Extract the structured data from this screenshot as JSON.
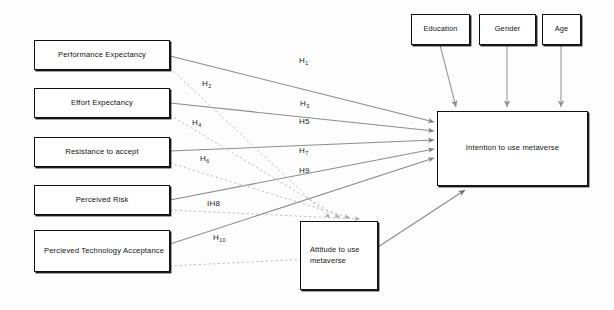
{
  "diagram": {
    "type": "conceptual-path-diagram",
    "colors": {
      "box_border": "#111111",
      "box_fill": "#ffffff",
      "solid_edge": "#8c8c8c",
      "dashed_edge": "#b4b4b4",
      "moderator_edge": "#9a9a9a",
      "label_text": "#1b1b1b",
      "background": "#fdfdfd"
    },
    "predictors": [
      {
        "id": "performance_expectancy",
        "label": "Performance Expectancy",
        "x": 34,
        "y": 40,
        "w": 136,
        "h": 30
      },
      {
        "id": "effort_expectancy",
        "label": "Effort Expectancy",
        "x": 34,
        "y": 88,
        "w": 136,
        "h": 30
      },
      {
        "id": "resistance_to_accept",
        "label": "Resistance to accept",
        "x": 34,
        "y": 137,
        "w": 136,
        "h": 30
      },
      {
        "id": "perceived_risk",
        "label": "Perceived Risk",
        "x": 34,
        "y": 185,
        "w": 136,
        "h": 30
      },
      {
        "id": "perceived_technology_acceptance",
        "label": "Percieved Technology Acceptance",
        "x": 34,
        "y": 230,
        "w": 136,
        "h": 42
      }
    ],
    "mediator": {
      "id": "attitude_to_use_metaverse",
      "label": "Attitude to use metaverse",
      "x": 300,
      "y": 221,
      "w": 78,
      "h": 69
    },
    "outcome": {
      "id": "intention_to_use_metaverse",
      "label": "Intention to use metaverse",
      "x": 437,
      "y": 111,
      "w": 151,
      "h": 75
    },
    "moderators": [
      {
        "id": "education",
        "label": "Education",
        "x": 411,
        "y": 14,
        "w": 59,
        "h": 31
      },
      {
        "id": "gender",
        "label": "Gender",
        "x": 479,
        "y": 14,
        "w": 57,
        "h": 31
      },
      {
        "id": "age",
        "label": "Age",
        "x": 542,
        "y": 14,
        "w": 39,
        "h": 31
      }
    ],
    "hypotheses": [
      {
        "id": "h1",
        "base": "H",
        "sub": "1",
        "x": 299,
        "y": 56,
        "style": "solid",
        "from": "performance_expectancy",
        "to": "intention_to_use_metaverse"
      },
      {
        "id": "h2",
        "base": "H",
        "sub": "2",
        "x": 202,
        "y": 79,
        "style": "dashed",
        "from": "performance_expectancy",
        "to": "attitude_to_use_metaverse"
      },
      {
        "id": "h3",
        "base": "H",
        "sub": "3",
        "x": 300,
        "y": 99,
        "style": "solid",
        "from": "effort_expectancy",
        "to": "intention_to_use_metaverse"
      },
      {
        "id": "h4",
        "base": "H",
        "sub": "4",
        "x": 192,
        "y": 118,
        "style": "dashed",
        "from": "effort_expectancy",
        "to": "attitude_to_use_metaverse"
      },
      {
        "id": "h5",
        "base": "H5",
        "sub": "",
        "x": 299,
        "y": 117,
        "style": "solid",
        "from": "resistance_to_accept",
        "to": "intention_to_use_metaverse"
      },
      {
        "id": "h6",
        "base": "H",
        "sub": "6",
        "x": 200,
        "y": 154,
        "style": "dashed",
        "from": "resistance_to_accept",
        "to": "attitude_to_use_metaverse"
      },
      {
        "id": "h7",
        "base": "H",
        "sub": "7",
        "x": 299,
        "y": 146,
        "style": "solid",
        "from": "perceived_risk",
        "to": "intention_to_use_metaverse"
      },
      {
        "id": "h8",
        "base": "IH8",
        "sub": "",
        "x": 207,
        "y": 199,
        "style": "dashed",
        "from": "perceived_risk",
        "to": "attitude_to_use_metaverse"
      },
      {
        "id": "h9",
        "base": "H9",
        "sub": "",
        "x": 299,
        "y": 166,
        "style": "solid",
        "from": "perceived_technology_acceptance",
        "to": "intention_to_use_metaverse"
      },
      {
        "id": "h10",
        "base": "H",
        "sub": "10",
        "x": 213,
        "y": 233,
        "style": "dashed",
        "from": "perceived_technology_acceptance",
        "to": "attitude_to_use_metaverse"
      }
    ]
  }
}
